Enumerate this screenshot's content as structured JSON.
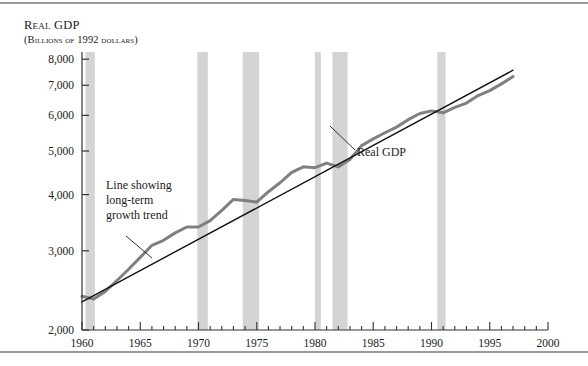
{
  "figure": {
    "title": "Real GDP",
    "subtitle": "(Billions of 1992 dollars)"
  },
  "annotations": {
    "trend": {
      "line1": "Line showing",
      "line2": "long-term",
      "line3": "growth trend"
    },
    "series": "Real GDP"
  },
  "colors": {
    "gdp_line": "#808080",
    "trend_line": "#111111",
    "recession_band": "#d4d4d4",
    "axis": "#333333",
    "rule": "#9a9a9a"
  },
  "chart_data": {
    "type": "line",
    "title": "Real GDP",
    "subtitle": "(Billions of 1992 dollars)",
    "xlabel": "",
    "ylabel": "Real GDP (Billions of 1992 dollars)",
    "xlim": [
      1960,
      2000
    ],
    "ylim": [
      2000,
      8300
    ],
    "yscale": "log",
    "grid": false,
    "legend": "none",
    "xticks": [
      1960,
      1965,
      1970,
      1975,
      1980,
      1985,
      1990,
      1995,
      2000
    ],
    "xtick_labels": [
      "1960",
      "1965",
      "1970",
      "1975",
      "1980",
      "1985",
      "1990",
      "1995",
      "2000"
    ],
    "xminor_step": 1,
    "yticks": [
      2000,
      3000,
      4000,
      5000,
      6000,
      7000,
      8000
    ],
    "ytick_labels": [
      "2,000",
      "3,000",
      "4,000",
      "5,000",
      "6,000",
      "7,000",
      "8,000"
    ],
    "series": [
      {
        "name": "Real GDP",
        "x": [
          1960,
          1961,
          1962,
          1963,
          1964,
          1965,
          1966,
          1967,
          1968,
          1969,
          1970,
          1971,
          1972,
          1973,
          1974,
          1975,
          1976,
          1977,
          1978,
          1979,
          1980,
          1981,
          1982,
          1983,
          1984,
          1985,
          1986,
          1987,
          1988,
          1989,
          1990,
          1991,
          1992,
          1993,
          1994,
          1995,
          1996,
          1997
        ],
        "values": [
          2377,
          2344,
          2437,
          2577,
          2729,
          2900,
          3086,
          3166,
          3288,
          3388,
          3388,
          3500,
          3690,
          3902,
          3880,
          3850,
          4060,
          4250,
          4480,
          4610,
          4590,
          4700,
          4610,
          4790,
          5140,
          5320,
          5490,
          5650,
          5870,
          6060,
          6140,
          6080,
          6250,
          6390,
          6640,
          6810,
          7050,
          7320
        ],
        "color": "#808080",
        "width": 3
      },
      {
        "name": "Line showing long-term growth trend",
        "x": [
          1960,
          1997
        ],
        "values": [
          2310,
          7560
        ],
        "color": "#111111",
        "width": 1.4,
        "style": "trend"
      }
    ],
    "shaded_regions": [
      {
        "label": "recession",
        "start": 1960.3,
        "end": 1961.1
      },
      {
        "label": "recession",
        "start": 1969.9,
        "end": 1970.8
      },
      {
        "label": "recession",
        "start": 1973.8,
        "end": 1975.2
      },
      {
        "label": "recession",
        "start": 1980.0,
        "end": 1980.5
      },
      {
        "label": "recession",
        "start": 1981.5,
        "end": 1982.8
      },
      {
        "label": "recession",
        "start": 1990.5,
        "end": 1991.2
      }
    ],
    "annotations": [
      {
        "text": "Line showing long-term growth trend",
        "x": 1964.5,
        "y": 3450,
        "points_to": [
          1967.5,
          2900
        ]
      },
      {
        "text": "Real GDP",
        "x": 1984.5,
        "y": 4200,
        "points_to": [
          1983.2,
          4800
        ]
      }
    ]
  }
}
